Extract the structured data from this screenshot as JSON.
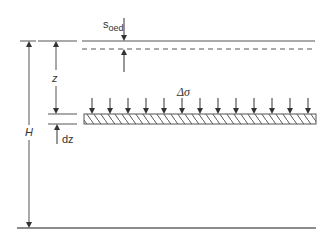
{
  "diagram": {
    "labels": {
      "settlement_main": "s",
      "settlement_sub": "oed",
      "depth": "z",
      "thickness": "H",
      "load_increment": "Δσ",
      "slice_thickness": "dz"
    },
    "elements": {
      "top_surface": "original ground surface (solid)",
      "settled_surface": "settled surface (dashed)",
      "bottom_boundary": "bottom of layer",
      "slice": "hatched slice of thickness dz at depth z",
      "load_arrows_count": 13
    },
    "colors": {
      "line": "#555555",
      "text": "#333333",
      "background": "#ffffff"
    }
  }
}
